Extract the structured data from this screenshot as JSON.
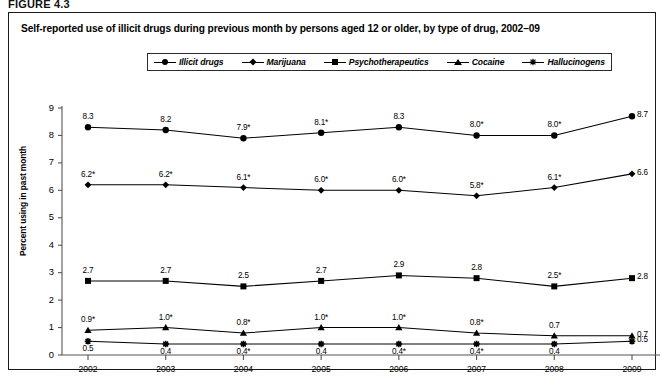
{
  "figure_label": "FIGURE 4.3",
  "title": "Self-reported use of illicit drugs during previous month by persons aged 12 or older, by type of drug, 2002–09",
  "legend": {
    "items": [
      {
        "label": "Illicit drugs",
        "marker": "circle"
      },
      {
        "label": "Marijuana",
        "marker": "diamond"
      },
      {
        "label": "Psychotherapeutics",
        "marker": "square"
      },
      {
        "label": "Cocaine",
        "marker": "triangle"
      },
      {
        "label": "Hallucinogens",
        "marker": "star"
      }
    ]
  },
  "chart_data": {
    "type": "line",
    "title": "Self-reported use of illicit drugs during previous month by persons aged 12 or older, by type of drug, 2002–09",
    "xlabel": "",
    "ylabel": "Percent using in past month",
    "categories": [
      "2002",
      "2003",
      "2004",
      "2005",
      "2006",
      "2007",
      "2008",
      "2009"
    ],
    "x": [
      2002,
      2003,
      2004,
      2005,
      2006,
      2007,
      2008,
      2009
    ],
    "ylim": [
      0,
      9
    ],
    "yticks": [
      0,
      1,
      2,
      3,
      4,
      5,
      6,
      7,
      8,
      9
    ],
    "ytick_labels": [
      "0",
      "1",
      "2",
      "3",
      "4",
      "5",
      "6",
      "7",
      "8",
      "9"
    ],
    "grid": false,
    "legend_position": "top",
    "series": [
      {
        "name": "Illicit drugs",
        "marker": "circle",
        "values": [
          8.3,
          8.2,
          7.9,
          8.1,
          8.3,
          8.0,
          8.0,
          8.7
        ],
        "labels": [
          "8.3",
          "8.2",
          "7.9*",
          "8.1*",
          "8.3",
          "8.0*",
          "8.0*",
          "8.7"
        ],
        "label_positions": [
          "above",
          "above",
          "above",
          "above",
          "above",
          "above",
          "above",
          "right"
        ]
      },
      {
        "name": "Marijuana",
        "marker": "diamond",
        "values": [
          6.2,
          6.2,
          6.1,
          6.0,
          6.0,
          5.8,
          6.1,
          6.6
        ],
        "labels": [
          "6.2*",
          "6.2*",
          "6.1*",
          "6.0*",
          "6.0*",
          "5.8*",
          "6.1*",
          "6.6"
        ],
        "label_positions": [
          "above",
          "above",
          "above",
          "above",
          "above",
          "above",
          "above",
          "right"
        ]
      },
      {
        "name": "Psychotherapeutics",
        "marker": "square",
        "values": [
          2.7,
          2.7,
          2.5,
          2.7,
          2.9,
          2.8,
          2.5,
          2.8
        ],
        "labels": [
          "2.7",
          "2.7",
          "2.5",
          "2.7",
          "2.9",
          "2.8",
          "2.5*",
          "2.8"
        ],
        "label_positions": [
          "above",
          "above",
          "above",
          "above",
          "above",
          "above",
          "above",
          "right"
        ]
      },
      {
        "name": "Cocaine",
        "marker": "triangle",
        "values": [
          0.9,
          1.0,
          0.8,
          1.0,
          1.0,
          0.8,
          0.7,
          0.7
        ],
        "labels": [
          "0.9*",
          "1.0*",
          "0.8*",
          "1.0*",
          "1.0*",
          "0.8*",
          "0.7",
          "0.7"
        ],
        "label_positions": [
          "above",
          "above",
          "above",
          "above",
          "above",
          "above",
          "above",
          "right"
        ]
      },
      {
        "name": "Hallucinogens",
        "marker": "star",
        "values": [
          0.5,
          0.4,
          0.4,
          0.4,
          0.4,
          0.4,
          0.4,
          0.5
        ],
        "labels": [
          "0.5",
          "0.4",
          "0.4*",
          "0.4",
          "0.4*",
          "0.4*",
          "0.4",
          "0.5"
        ],
        "label_positions": [
          "below",
          "below",
          "below",
          "below",
          "below",
          "below",
          "below",
          "right"
        ]
      }
    ]
  }
}
